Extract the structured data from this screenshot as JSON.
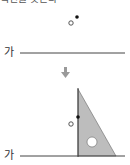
{
  "header": {
    "clipped_text": "직선을 긋는다 ㆍ"
  },
  "step1": {
    "line_label": "가",
    "point_filled": {
      "x": 77,
      "y": 17
    },
    "point_open": {
      "x": 71,
      "y": 23
    }
  },
  "arrow": {
    "direction": "down",
    "color": "#9a9a9a"
  },
  "step2": {
    "line_label": "가",
    "triangle": {
      "fill": "#bdbdbd",
      "stroke": "#555555",
      "vertices": [
        [
          78,
          89
        ],
        [
          78,
          156
        ],
        [
          116,
          156
        ]
      ],
      "hole": {
        "cx": 92,
        "cy": 142,
        "r": 5
      }
    },
    "point_filled": {
      "x": 78,
      "y": 117
    },
    "point_open": {
      "x": 71,
      "y": 124
    }
  },
  "colors": {
    "line": "#444444",
    "text": "#333333"
  }
}
